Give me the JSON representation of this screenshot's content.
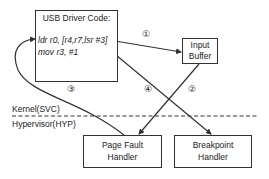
{
  "diagram": {
    "nodes": {
      "usb_driver": {
        "title": "USB Driver Code:",
        "code_lines": [
          "ldr r0, [r4,r7,lsr #3]",
          "mov r3, #1"
        ]
      },
      "input_buffer": {
        "line1": "Input",
        "line2": "Buffer"
      },
      "page_fault_handler": {
        "line1": "Page Fault",
        "line2": "Handler"
      },
      "breakpoint_handler": {
        "line1": "Breakpoint",
        "line2": "Handler"
      }
    },
    "privilege_levels": {
      "upper": "Kernel(SVC)",
      "lower": "Hypervisor(HYP)"
    },
    "steps": [
      "①",
      "②",
      "③",
      "④"
    ],
    "edges": [
      {
        "step": "①",
        "from": "usb_driver.ldr",
        "to": "input_buffer"
      },
      {
        "step": "②",
        "from": "input_buffer",
        "to": "page_fault_handler"
      },
      {
        "step": "③",
        "from": "page_fault_handler",
        "to": "usb_driver.ldr"
      },
      {
        "step": "④",
        "from": "usb_driver",
        "to": "breakpoint_handler"
      }
    ],
    "colors": {
      "stroke": "#333333",
      "text": "#222222",
      "background": "#ffffff"
    }
  }
}
